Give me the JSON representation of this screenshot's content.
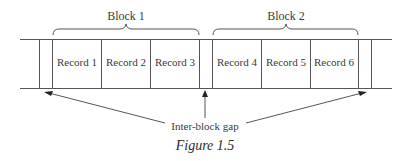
{
  "blocks": [
    {
      "label": "Block 1",
      "records": [
        "Record 1",
        "Record 2",
        "Record 3"
      ]
    },
    {
      "label": "Block 2",
      "records": [
        "Record 4",
        "Record 5",
        "Record 6"
      ]
    }
  ],
  "gap_label": "Inter-block gap",
  "caption": "Figure 1.5"
}
